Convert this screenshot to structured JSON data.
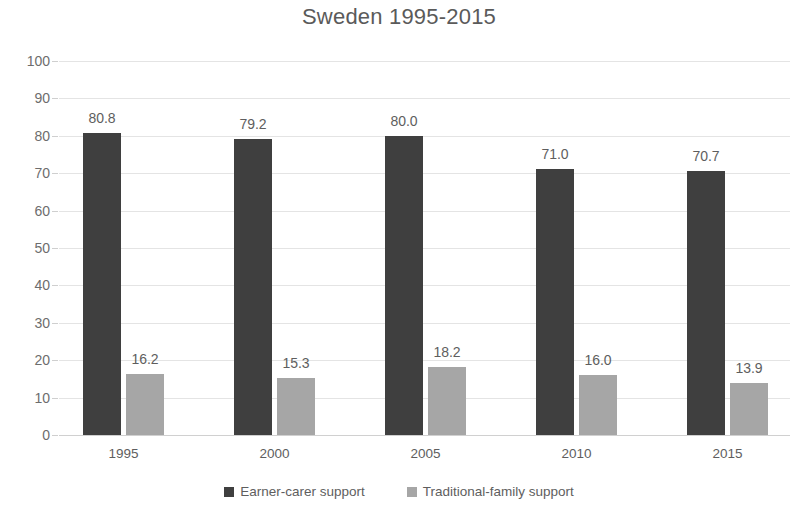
{
  "chart_data": {
    "type": "bar",
    "title": "Sweden 1995-2015",
    "xlabel": "",
    "ylabel": "",
    "ylim": [
      0,
      100
    ],
    "yticks": [
      0,
      10,
      20,
      30,
      40,
      50,
      60,
      70,
      80,
      90,
      100
    ],
    "grid": true,
    "legend_position": "bottom",
    "categories": [
      "1995",
      "2000",
      "2005",
      "2010",
      "2015"
    ],
    "series": [
      {
        "name": "Earner-carer support",
        "color": "#3f3f3f",
        "values": [
          80.8,
          79.2,
          80.0,
          71.0,
          70.7
        ],
        "labels": [
          "80.8",
          "79.2",
          "80.0",
          "71.0",
          "70.7"
        ]
      },
      {
        "name": "Traditional-family support",
        "color": "#a6a6a6",
        "values": [
          16.2,
          15.3,
          18.2,
          16.0,
          13.9
        ],
        "labels": [
          "16.2",
          "15.3",
          "18.2",
          "16.0",
          "13.9"
        ]
      }
    ]
  },
  "axis": {
    "y_tick_labels": [
      "100",
      "90",
      "80",
      "70",
      "60",
      "50",
      "40",
      "30",
      "20",
      "10",
      "0"
    ],
    "x_tick_labels": [
      "1995",
      "2000",
      "2005",
      "2010",
      "2015"
    ]
  },
  "legend": {
    "items": [
      {
        "label": "Earner-carer support",
        "color": "#3f3f3f"
      },
      {
        "label": "Traditional-family support",
        "color": "#a6a6a6"
      }
    ]
  }
}
